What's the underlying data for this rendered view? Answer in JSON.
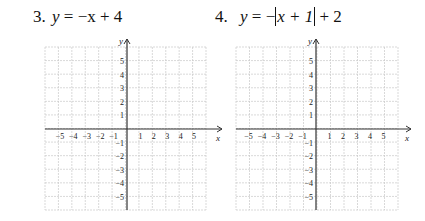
{
  "problems": [
    {
      "number": "3.",
      "equation_lhs": "y",
      "equation_rhs": "= −x + 4",
      "graph": {
        "x_label": "x",
        "y_label": "y",
        "x_ticks": [
          "−5",
          "−4",
          "−3",
          "−2",
          "−1",
          "1",
          "2",
          "3",
          "4",
          "5"
        ],
        "y_ticks": [
          "5",
          "4",
          "3",
          "2",
          "1",
          "−1",
          "−2",
          "−3",
          "−4",
          "−5"
        ],
        "range": [
          -6,
          6
        ]
      }
    },
    {
      "number": "4.",
      "equation_lhs": "y",
      "equation_rhs_pre": "= −",
      "equation_abs": "x + 1",
      "equation_rhs_post": "+ 2",
      "graph": {
        "x_label": "x",
        "y_label": "y",
        "x_ticks": [
          "−5",
          "−4",
          "−3",
          "−2",
          "−1",
          "1",
          "2",
          "3",
          "4",
          "5"
        ],
        "y_ticks": [
          "5",
          "4",
          "3",
          "2",
          "1",
          "−1",
          "−2",
          "−3",
          "−4",
          "−5"
        ],
        "range": [
          -6,
          6
        ]
      }
    }
  ],
  "colors": {
    "grid": "#c8c8c8",
    "axis": "#333333",
    "text": "#111111"
  }
}
